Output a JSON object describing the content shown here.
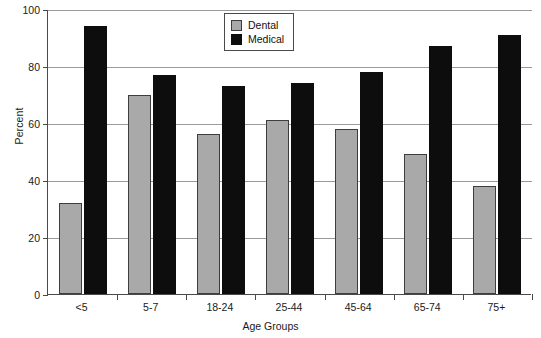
{
  "chart_data": {
    "type": "bar",
    "title": "",
    "subtitle": "",
    "xlabel": "Age Groups",
    "ylabel": "Percent",
    "categories": [
      "<5",
      "5-7",
      "18-24",
      "25-44",
      "45-64",
      "65-74",
      "75+"
    ],
    "series": [
      {
        "name": "Dental",
        "color": "#a9a9a9",
        "values": [
          32,
          70,
          56,
          61,
          58,
          49,
          38
        ]
      },
      {
        "name": "Medical",
        "color": "#0d0d0d",
        "values": [
          94,
          77,
          73,
          74,
          78,
          87,
          91
        ]
      }
    ],
    "ylim": [
      0,
      100
    ],
    "yticks": [
      0,
      20,
      40,
      60,
      80,
      100
    ],
    "ytick_labels": [
      "0",
      "20",
      "40",
      "60",
      "80",
      "100"
    ],
    "grid": true,
    "grid_axis": "y",
    "legend_position": "top-center",
    "legend_entries": [
      "Dental",
      "Medical"
    ]
  }
}
